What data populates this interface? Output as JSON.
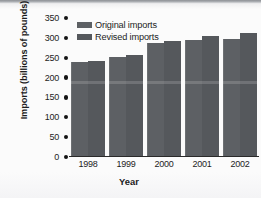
{
  "chart_data": {
    "type": "bar",
    "title": "",
    "xlabel": "Year",
    "ylabel": "Imports (billions of pounds)",
    "categories": [
      "1998",
      "1999",
      "2000",
      "2001",
      "2002"
    ],
    "series": [
      {
        "name": "Original imports",
        "values": [
          238,
          253,
          287,
          295,
          297
        ],
        "color": "#5d6064"
      },
      {
        "name": "Revised imports",
        "values": [
          242,
          257,
          291,
          305,
          312
        ],
        "color": "#55585c"
      }
    ],
    "ylim": [
      0,
      350
    ],
    "ytick_values": [
      350,
      300,
      250,
      200,
      150,
      100,
      50,
      0
    ],
    "ytick_labels": [
      "350",
      "300",
      "250",
      "200",
      "150",
      "100",
      "50",
      "0"
    ],
    "ytick_marker": "filled-circle",
    "grid": false,
    "legend_position": "top-left-inside",
    "orientation": "vertical",
    "grouping": "grouped"
  },
  "legend": {
    "items": [
      {
        "label": "Original imports",
        "swatch": "legend-swatch-original"
      },
      {
        "label": "Revised imports",
        "swatch": "legend-swatch-revised"
      }
    ]
  },
  "colors": {
    "bar_original": "#5d6064",
    "bar_revised": "#55585c",
    "axis": "#2a2a2a",
    "text": "#1d1d1d",
    "background": "#fbfbfb"
  }
}
